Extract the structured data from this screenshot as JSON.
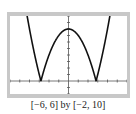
{
  "chart_data": {
    "type": "line",
    "title": "",
    "function": "y = |x^2 - 8|",
    "caption": "[−6, 6] by [−2, 10]",
    "xlim": [
      -6,
      6
    ],
    "ylim": [
      -2,
      10
    ],
    "xscale_tick": 1,
    "yscale_tick": 1,
    "grid": false,
    "xlabel": "",
    "ylabel": "",
    "series": [
      {
        "name": "curve",
        "x": [
          -4.24,
          -4,
          -3.5,
          -3,
          -2.83,
          -2.5,
          -2,
          -1.5,
          -1,
          -0.5,
          0,
          0.5,
          1,
          1.5,
          2,
          2.5,
          2.83,
          3,
          3.5,
          4,
          4.24
        ],
        "y": [
          10,
          8,
          4.25,
          1,
          0,
          1.75,
          4,
          5.75,
          7,
          7.75,
          8,
          7.75,
          7,
          5.75,
          4,
          1.75,
          0,
          1,
          4.25,
          8,
          10
        ]
      }
    ],
    "colors": {
      "curve": "#111111",
      "axes": "#555555",
      "frame": "#c8c8c8"
    }
  }
}
